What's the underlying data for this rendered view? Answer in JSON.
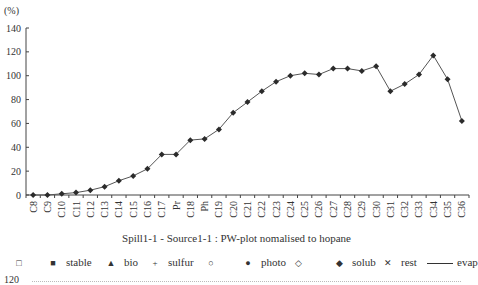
{
  "chart_data": {
    "type": "line",
    "title": "Spill1-1 - Source1-1 : PW-plot nomalised to hopane",
    "ylabel": "(%)",
    "xlabel": "",
    "ylim": [
      0,
      140
    ],
    "yticks": [
      0,
      20,
      40,
      60,
      80,
      100,
      120,
      140
    ],
    "grid": false,
    "legend_position": "bottom",
    "categories": [
      "C8",
      "C9",
      "C10",
      "C11",
      "C12",
      "C13",
      "C14",
      "C15",
      "C16",
      "C17",
      "Pr",
      "C18",
      "Ph",
      "C19",
      "C20",
      "C21",
      "C22",
      "C23",
      "C24",
      "C25",
      "C26",
      "C27",
      "C28",
      "C29",
      "C30",
      "C31",
      "C32",
      "C33",
      "C34",
      "C35",
      "C36"
    ],
    "series": [
      {
        "name": "solub",
        "marker": "diamond",
        "values": [
          0,
          0,
          1,
          2,
          4,
          7,
          12,
          16,
          22,
          34,
          34,
          46,
          47,
          55,
          69,
          78,
          87,
          95,
          100,
          102,
          101,
          106,
          106,
          104,
          108,
          87,
          93,
          101,
          117,
          97,
          62
        ]
      }
    ],
    "legend": [
      "",
      "stable",
      "bio",
      "sulfur",
      "",
      "photo",
      "",
      "solub",
      "rest",
      "evap"
    ]
  },
  "legend_items": [
    {
      "symbol": "□",
      "label": ""
    },
    {
      "symbol": "■",
      "label": "stable"
    },
    {
      "symbol": "▲",
      "label": "bio"
    },
    {
      "symbol": "+",
      "label": "sulfur"
    },
    {
      "symbol": "○",
      "label": ""
    },
    {
      "symbol": "●",
      "label": "photo"
    },
    {
      "symbol": "◇",
      "label": ""
    },
    {
      "symbol": "◆",
      "label": "solub"
    },
    {
      "symbol": "✕",
      "label": "rest"
    },
    {
      "symbol": "line",
      "label": "evap"
    }
  ],
  "next_chart": {
    "ytick_top": "120"
  }
}
